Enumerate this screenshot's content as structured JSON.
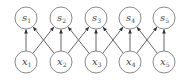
{
  "diagram": {
    "type": "bipartite-graph",
    "top_row": [
      {
        "id": "s1",
        "base": "s",
        "sub": "1",
        "cx": 26,
        "cy": 18
      },
      {
        "id": "s2",
        "base": "s",
        "sub": "2",
        "cx": 61,
        "cy": 18
      },
      {
        "id": "s3",
        "base": "s",
        "sub": "3",
        "cx": 96,
        "cy": 18
      },
      {
        "id": "s4",
        "base": "s",
        "sub": "4",
        "cx": 130,
        "cy": 18
      },
      {
        "id": "s5",
        "base": "s",
        "sub": "5",
        "cx": 164,
        "cy": 18
      }
    ],
    "bottom_row": [
      {
        "id": "x1",
        "base": "x",
        "sub": "1",
        "cx": 26,
        "cy": 62
      },
      {
        "id": "x2",
        "base": "x",
        "sub": "2",
        "cx": 61,
        "cy": 62
      },
      {
        "id": "x3",
        "base": "x",
        "sub": "3",
        "cx": 96,
        "cy": 62
      },
      {
        "id": "x4",
        "base": "x",
        "sub": "4",
        "cx": 130,
        "cy": 62
      },
      {
        "id": "x5",
        "base": "x",
        "sub": "5",
        "cx": 164,
        "cy": 62
      }
    ],
    "edges": [
      [
        "x1",
        "s1"
      ],
      [
        "x1",
        "s2"
      ],
      [
        "x2",
        "s1"
      ],
      [
        "x2",
        "s2"
      ],
      [
        "x2",
        "s3"
      ],
      [
        "x3",
        "s2"
      ],
      [
        "x3",
        "s3"
      ],
      [
        "x3",
        "s4"
      ],
      [
        "x4",
        "s3"
      ],
      [
        "x4",
        "s4"
      ],
      [
        "x4",
        "s5"
      ],
      [
        "x5",
        "s4"
      ],
      [
        "x5",
        "s5"
      ]
    ],
    "node_radius": 11,
    "colors": {
      "node_stroke": "#8a8a8a",
      "edge": "#555555",
      "label": "#444444"
    }
  }
}
